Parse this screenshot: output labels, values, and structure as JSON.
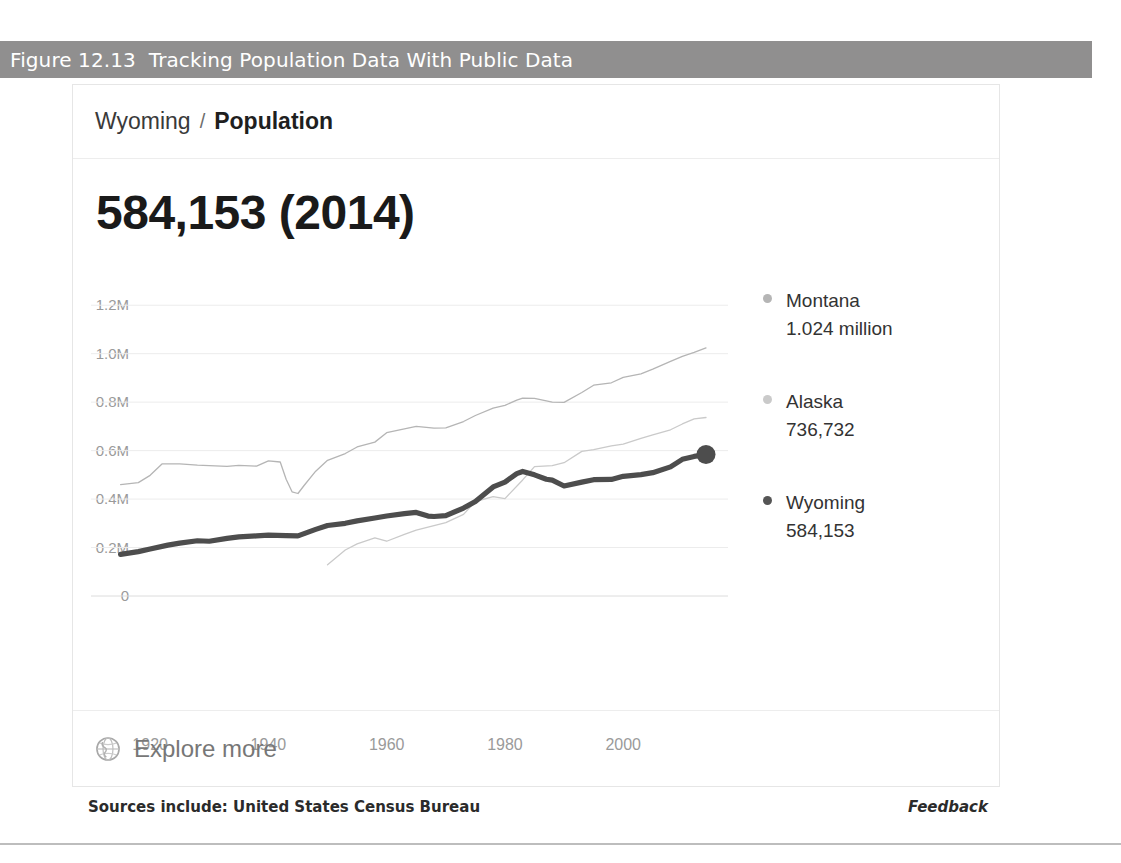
{
  "figure": {
    "caption_number": "Figure 12.13",
    "caption_title": "Tracking Population Data With Public Data",
    "band_color": "#908f8f"
  },
  "card": {
    "breadcrumb": {
      "place": "Wyoming",
      "separator": "/",
      "metric": "Population"
    },
    "headline": "584,153 (2014)",
    "explore": {
      "icon": "globe-icon",
      "label": "Explore more"
    }
  },
  "footer": {
    "sources": "Sources include: United States Census Bureau",
    "feedback": "Feedback"
  },
  "legend": {
    "items": [
      {
        "name": "Montana",
        "value": "1.024 million",
        "color": "#b5b5b5"
      },
      {
        "name": "Alaska",
        "value": "736,732",
        "color": "#c9c9c9"
      },
      {
        "name": "Wyoming",
        "value": "584,153",
        "color": "#555555"
      }
    ]
  },
  "chart_data": {
    "type": "line",
    "title": "Population",
    "xlabel": "",
    "ylabel": "",
    "xlim": [
      1910,
      2014
    ],
    "ylim": [
      0,
      1300000
    ],
    "grid": true,
    "legend_position": "right",
    "yticks": [
      "0",
      "0.2M",
      "0.4M",
      "0.6M",
      "0.8M",
      "1.0M",
      "1.2M"
    ],
    "ytick_values": [
      0,
      200000,
      400000,
      600000,
      800000,
      1000000,
      1200000
    ],
    "xticks": [
      "1920",
      "1940",
      "1960",
      "1980",
      "2000"
    ],
    "xtick_values": [
      1920,
      1940,
      1960,
      1980,
      2000
    ],
    "highlight_point": {
      "series": "Wyoming",
      "x": 2014,
      "y": 584153,
      "label": "584,153 (2014)"
    },
    "series": [
      {
        "name": "Montana",
        "color": "#b5b5b5",
        "width": 1.3,
        "x": [
          1915,
          1918,
          1920,
          1922,
          1925,
          1928,
          1930,
          1933,
          1935,
          1938,
          1940,
          1942,
          1943,
          1944,
          1945,
          1946,
          1948,
          1950,
          1953,
          1955,
          1958,
          1960,
          1963,
          1965,
          1968,
          1970,
          1973,
          1975,
          1978,
          1980,
          1982,
          1983,
          1985,
          1988,
          1990,
          1993,
          1995,
          1998,
          2000,
          2003,
          2005,
          2008,
          2010,
          2012,
          2014
        ],
        "y": [
          460000,
          468000,
          498000,
          545000,
          545000,
          540000,
          538000,
          535000,
          539000,
          536000,
          558000,
          553000,
          482000,
          430000,
          423000,
          455000,
          515000,
          560000,
          588000,
          615000,
          635000,
          674000,
          690000,
          700000,
          693000,
          694000,
          720000,
          745000,
          775000,
          787000,
          808000,
          817000,
          816000,
          800000,
          799000,
          840000,
          870000,
          880000,
          902000,
          917000,
          936000,
          968000,
          989000,
          1005000,
          1024000
        ]
      },
      {
        "name": "Alaska",
        "color": "#cacaca",
        "width": 1.3,
        "x": [
          1950,
          1953,
          1955,
          1958,
          1960,
          1963,
          1965,
          1968,
          1970,
          1973,
          1975,
          1978,
          1980,
          1983,
          1985,
          1988,
          1990,
          1993,
          1995,
          1998,
          2000,
          2003,
          2005,
          2008,
          2010,
          2012,
          2014
        ],
        "y": [
          129000,
          190000,
          215000,
          240000,
          226000,
          254000,
          272000,
          290000,
          303000,
          337000,
          390000,
          410000,
          402000,
          479000,
          534000,
          538000,
          550000,
          597000,
          604000,
          620000,
          627000,
          651000,
          665000,
          686000,
          710000,
          731000,
          736732
        ]
      },
      {
        "name": "Wyoming",
        "color": "#4d4d4d",
        "width": 5.2,
        "x": [
          1915,
          1918,
          1920,
          1923,
          1925,
          1928,
          1930,
          1933,
          1935,
          1938,
          1940,
          1943,
          1945,
          1948,
          1950,
          1953,
          1955,
          1958,
          1960,
          1963,
          1965,
          1967,
          1968,
          1970,
          1973,
          1975,
          1978,
          1980,
          1982,
          1983,
          1985,
          1987,
          1988,
          1990,
          1993,
          1995,
          1998,
          2000,
          2003,
          2005,
          2008,
          2010,
          2012,
          2014
        ],
        "y": [
          172000,
          183000,
          194000,
          210000,
          218000,
          228000,
          226000,
          238000,
          244000,
          248000,
          251000,
          249000,
          248000,
          275000,
          291000,
          300000,
          310000,
          322000,
          330000,
          340000,
          345000,
          330000,
          328000,
          332000,
          363000,
          390000,
          450000,
          470000,
          505000,
          514000,
          500000,
          482000,
          478000,
          454000,
          470000,
          480000,
          481000,
          494000,
          501000,
          509000,
          533000,
          564000,
          576000,
          584153
        ]
      }
    ]
  }
}
